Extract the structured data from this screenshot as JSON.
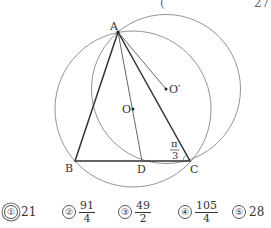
{
  "header": {
    "paren": "(",
    "page_fragment": "27"
  },
  "figure": {
    "points": {
      "A": {
        "label": "A",
        "x": 118,
        "y": 32
      },
      "B": {
        "label": "B",
        "x": 75,
        "y": 161
      },
      "C": {
        "label": "C",
        "x": 190,
        "y": 161
      },
      "D": {
        "label": "D",
        "x": 142,
        "y": 161
      },
      "O": {
        "label": "O",
        "x": 133,
        "y": 109
      },
      "O_prime": {
        "label": "O′",
        "x": 166,
        "y": 89
      }
    },
    "circles": [
      {
        "center": "O",
        "r": 78
      },
      {
        "center": "O_prime",
        "r": 74.5
      }
    ],
    "angle_label": {
      "numerator": "π",
      "denominator": "3"
    }
  },
  "choices": [
    {
      "num": "①",
      "value": "21",
      "selected": true
    },
    {
      "num": "②",
      "numerator": "91",
      "denominator": "4"
    },
    {
      "num": "③",
      "numerator": "49",
      "denominator": "2"
    },
    {
      "num": "④",
      "numerator": "105",
      "denominator": "4"
    },
    {
      "num": "⑤",
      "value": "28"
    }
  ]
}
